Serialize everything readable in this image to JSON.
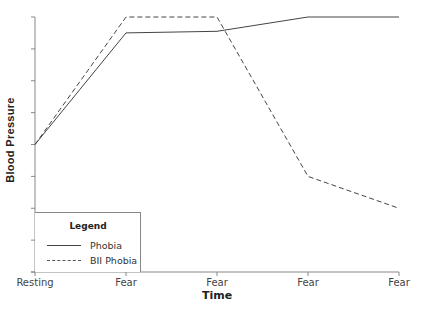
{
  "chart_data": {
    "type": "line",
    "title": "",
    "xlabel": "Time",
    "ylabel": "Blood Pressure",
    "categories": [
      "Resting",
      "Fear",
      "Fear",
      "Fear",
      "Fear"
    ],
    "series": [
      {
        "name": "Phobia",
        "style": "solid",
        "values": [
          4,
          7.5,
          7.55,
          8,
          8
        ]
      },
      {
        "name": "BII Phobia",
        "style": "dashed",
        "values": [
          4,
          8,
          8,
          3,
          2
        ]
      }
    ],
    "ylim": [
      0,
      8
    ],
    "y_tick_count": 9,
    "y_tick_labels": [],
    "grid": false,
    "legend": {
      "title": "Legend",
      "position": "lower-left",
      "entries": [
        "Phobia",
        "BII Phobia"
      ]
    }
  },
  "axes": {
    "xlabel": "Time",
    "ylabel": "Blood Pressure",
    "xticks": [
      "Resting",
      "Fear",
      "Fear",
      "Fear",
      "Fear"
    ]
  },
  "legend": {
    "title": "Legend",
    "items": [
      {
        "label": "Phobia",
        "style": "solid"
      },
      {
        "label": "BII Phobia",
        "style": "dashed"
      }
    ]
  },
  "colors": {
    "axis": "#888888",
    "line": "#444444"
  }
}
